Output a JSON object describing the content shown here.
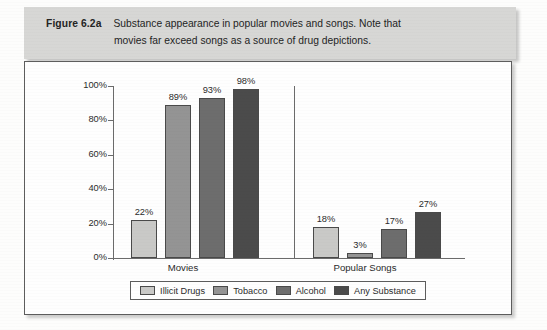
{
  "figure": {
    "label": "Figure 6.2a",
    "caption_line1": "Substance appearance in popular movies and songs. Note that",
    "caption_line2": "movies far exceed songs as a source of drug depictions."
  },
  "colors": {
    "illicit_drugs": "#c9c9c7",
    "tobacco": "#949494",
    "alcohol": "#6d6d6d",
    "any_substance": "#4b4b4b",
    "axis": "#6b6b6b",
    "caption_band": "#d7d7d5",
    "box_border": "#5d5d5d"
  },
  "chart_data": {
    "type": "bar",
    "title": "Substance appearance in popular movies and songs",
    "xlabel": "",
    "ylabel": "",
    "ylim": [
      0,
      100
    ],
    "yticks": [
      "0%",
      "20%",
      "40%",
      "60%",
      "80%",
      "100%"
    ],
    "ytick_values": [
      0,
      20,
      40,
      60,
      80,
      100
    ],
    "grid": false,
    "legend_position": "bottom",
    "categories": [
      "Movies",
      "Popular Songs"
    ],
    "series": [
      {
        "name": "Illicit Drugs",
        "values": [
          22,
          18
        ],
        "labels": [
          "22%",
          "18%"
        ],
        "color": "#c9c9c7"
      },
      {
        "name": "Tobacco",
        "values": [
          89,
          3
        ],
        "labels": [
          "89%",
          "3%"
        ],
        "color": "#949494"
      },
      {
        "name": "Alcohol",
        "values": [
          93,
          17
        ],
        "labels": [
          "93%",
          "17%"
        ],
        "color": "#6d6d6d"
      },
      {
        "name": "Any Substance",
        "values": [
          98,
          27
        ],
        "labels": [
          "98%",
          "27%"
        ],
        "color": "#4b4b4b"
      }
    ]
  }
}
